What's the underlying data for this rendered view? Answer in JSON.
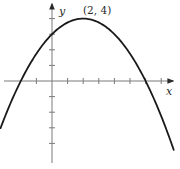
{
  "chart_data": {
    "type": "line",
    "title": "",
    "xlabel": "x",
    "ylabel": "y",
    "function": "y = -(1/4)(x - 2)^2 + 4",
    "series": [
      {
        "name": "parabola",
        "x": [
          -3.2,
          -2,
          -1,
          0,
          1,
          2,
          3,
          4,
          5,
          6,
          7,
          7.8
        ],
        "values": [
          -2.76,
          0,
          1.75,
          3,
          3.75,
          4,
          3.75,
          3,
          1.75,
          0,
          -2.25,
          -4.41
        ]
      }
    ],
    "annotations": [
      {
        "text": "(2, 4)",
        "x": 2,
        "y": 4,
        "role": "vertex"
      }
    ],
    "xlim": [
      -3.3,
      7.8
    ],
    "ylim": [
      -4.5,
      4.8
    ],
    "x_ticks": [
      -1,
      1,
      2,
      3,
      4,
      5,
      6,
      7
    ],
    "y_ticks": [
      -4,
      -3,
      -2,
      -1,
      1,
      2,
      3,
      4
    ],
    "tick_labels_shown": false,
    "grid": false,
    "legend": null,
    "colors": {
      "curve": "#1a1a1a",
      "axes": "#7a7a7a"
    }
  },
  "labels": {
    "x_axis": "x",
    "y_axis": "y",
    "vertex": "(2, 4)"
  }
}
